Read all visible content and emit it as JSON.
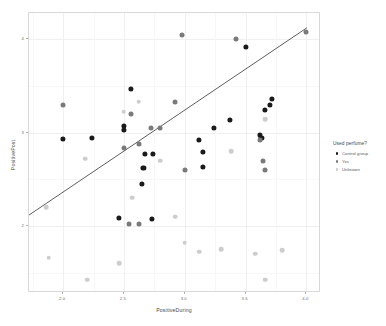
{
  "chart_data": {
    "type": "scatter",
    "title": "",
    "xlabel": "PositiveDuring",
    "ylabel": "PositivePost",
    "xlim": [
      1.72,
      4.12
    ],
    "ylim": [
      1.28,
      4.28
    ],
    "xticks": [
      "2.0",
      "2.5",
      "3.0",
      "3.5",
      "4.0"
    ],
    "xtick_values": [
      2.0,
      2.5,
      3.0,
      3.5,
      4.0
    ],
    "yticks": [
      "2",
      "3",
      "4"
    ],
    "ytick_values": [
      2,
      3,
      4
    ],
    "grid": true,
    "legend_position": "right",
    "legend_title": "Used perfume?",
    "series": [
      {
        "name": "Control group",
        "color": "#1a1a1a",
        "points": [
          [
            2.0,
            2.93
          ],
          [
            2.24,
            2.94
          ],
          [
            2.5,
            3.07
          ],
          [
            2.5,
            3.03
          ],
          [
            2.56,
            3.47
          ],
          [
            2.67,
            2.77
          ],
          [
            2.74,
            2.77
          ],
          [
            2.66,
            2.62
          ],
          [
            2.65,
            2.45
          ],
          [
            2.46,
            2.08
          ],
          [
            2.73,
            2.07
          ],
          [
            3.12,
            2.92
          ],
          [
            3.15,
            2.79
          ],
          [
            3.15,
            2.63
          ],
          [
            3.24,
            3.05
          ],
          [
            3.37,
            3.13
          ],
          [
            3.5,
            3.92
          ],
          [
            3.62,
            2.97
          ],
          [
            3.63,
            2.94
          ],
          [
            3.66,
            3.24
          ],
          [
            3.7,
            3.3
          ],
          [
            3.72,
            3.36
          ]
        ]
      },
      {
        "name": "Yes",
        "color": "#7a7a7a",
        "points": [
          [
            2.0,
            3.29
          ],
          [
            2.5,
            2.83
          ],
          [
            2.56,
            3.2
          ],
          [
            2.62,
            2.88
          ],
          [
            2.72,
            3.05
          ],
          [
            2.8,
            3.05
          ],
          [
            2.92,
            3.33
          ],
          [
            2.98,
            4.04
          ],
          [
            3.0,
            2.6
          ],
          [
            3.42,
            4.0
          ],
          [
            3.62,
            2.92
          ],
          [
            3.64,
            2.7
          ],
          [
            3.66,
            2.6
          ],
          [
            4.0,
            4.08
          ],
          [
            2.54,
            2.02
          ],
          [
            2.62,
            2.02
          ]
        ]
      },
      {
        "name": "Unknown",
        "color": "#cdcdcd",
        "points": [
          [
            1.86,
            2.2
          ],
          [
            2.18,
            2.72
          ],
          [
            2.5,
            3.22
          ],
          [
            2.62,
            3.33
          ],
          [
            2.57,
            2.3
          ],
          [
            2.8,
            2.7
          ],
          [
            2.92,
            2.1
          ],
          [
            3.0,
            1.82
          ],
          [
            3.12,
            1.72
          ],
          [
            3.3,
            1.75
          ],
          [
            3.38,
            2.8
          ],
          [
            3.58,
            1.7
          ],
          [
            3.66,
            3.14
          ],
          [
            3.8,
            1.74
          ],
          [
            2.2,
            1.42
          ],
          [
            2.46,
            1.6
          ],
          [
            1.88,
            1.66
          ],
          [
            3.66,
            1.42
          ]
        ]
      }
    ],
    "fit_line": {
      "x_start": 1.72,
      "y_start": 2.1,
      "x_end": 4.02,
      "y_end": 4.12,
      "color": "#4d4d4d"
    }
  },
  "legend": {
    "title": "Used perfume?",
    "items": [
      {
        "label": "Control group",
        "color": "#1a1a1a"
      },
      {
        "label": "Yes",
        "color": "#7a7a7a"
      },
      {
        "label": "Unknown",
        "color": "#cdcdcd"
      }
    ]
  },
  "axes": {
    "x_label": "PositiveDuring",
    "y_label": "PositivePost"
  }
}
